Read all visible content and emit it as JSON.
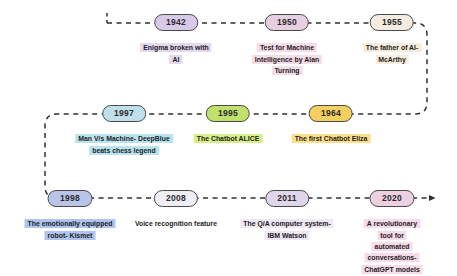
{
  "connector": {
    "style": "dashed",
    "color": "#2f2f2f",
    "end_marker": "arrowhead-right-icon"
  },
  "milestones": [
    {
      "year": "1942",
      "caption": "Enigma broken with\nAI",
      "pill_color": "#d9c9e8",
      "pill_border": "#4a4a4a",
      "caption_highlight": "#e4d7f0",
      "row": 1,
      "x": 176,
      "y": 14
    },
    {
      "year": "1950",
      "caption": "Test for Machine\nIntelligence by Alan\nTurning",
      "pill_color": "#e7cfe2",
      "pill_border": "#4a4a4a",
      "caption_highlight": "#f6dce9",
      "row": 1,
      "x": 287,
      "y": 14
    },
    {
      "year": "1955",
      "caption": "The father of AI-\nMcArthy",
      "pill_color": "#f4ece0",
      "pill_border": "#4a4a4a",
      "caption_highlight": "#f7eddc",
      "row": 1,
      "x": 392,
      "y": 14
    },
    {
      "year": "1997",
      "caption": "Man V/s Machine- DeepBlue\nbeats chess legend",
      "pill_color": "#bfe0ea",
      "pill_border": "#4a4a4a",
      "caption_highlight": "#b9e4ef",
      "row": 2,
      "x": 124,
      "y": 105
    },
    {
      "year": "1995",
      "caption": "The Chatbot ALICE",
      "pill_color": "#bfe06a",
      "pill_border": "#4a4a4a",
      "caption_highlight": "#d7ef8a",
      "row": 2,
      "x": 228,
      "y": 105
    },
    {
      "year": "1964",
      "caption": "The first Chatbot Eliza",
      "pill_color": "#f2cf5e",
      "pill_border": "#4a4a4a",
      "caption_highlight": "#fbe08a",
      "row": 2,
      "x": 331,
      "y": 105
    },
    {
      "year": "1998",
      "caption": "The emotionally equipped\nrobot- Kismet",
      "pill_color": "#b9c5e8",
      "pill_border": "#4a4a4a",
      "caption_highlight": "#aec4ef",
      "row": 3,
      "x": 70,
      "y": 190
    },
    {
      "year": "2008",
      "caption": "Voice recognition feature",
      "pill_color": "#efeef6",
      "pill_border": "#4a4a4a",
      "caption_highlight": "#ffffff",
      "row": 3,
      "x": 176,
      "y": 190
    },
    {
      "year": "2011",
      "caption": "The Q/A computer system-\nIBM Watson",
      "pill_color": "#e0d6ea",
      "pill_border": "#4a4a4a",
      "caption_highlight": "#efe7f4",
      "row": 3,
      "x": 287,
      "y": 190
    },
    {
      "year": "2020",
      "caption": "A revolutionary tool for\nautomated conversations-\nChatGPT models",
      "pill_color": "#eccfe0",
      "pill_border": "#4a4a4a",
      "caption_highlight": "#f8dbe8",
      "row": 3,
      "x": 392,
      "y": 190
    }
  ]
}
